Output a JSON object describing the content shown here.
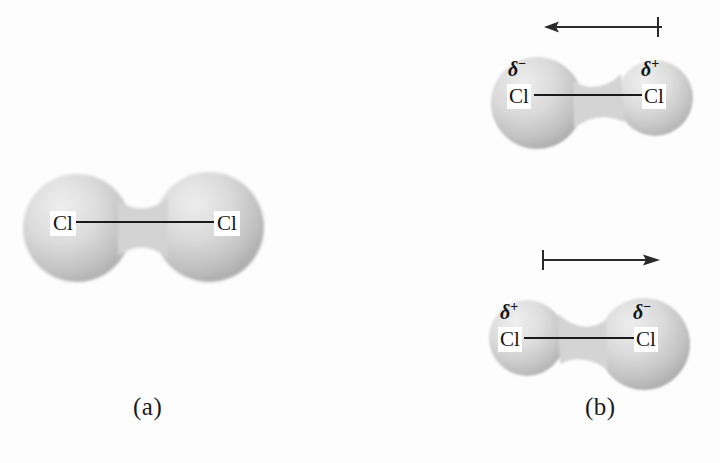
{
  "figure": {
    "background_color": "#fdfdfd",
    "sphere_light": "#ececec",
    "sphere_mid": "#d2d2d2",
    "sphere_dark": "#b0b0b0",
    "line_color": "#1a1a1a",
    "text_color": "#141414"
  },
  "panels": [
    {
      "id": "a",
      "label": "(a)",
      "description": "nonpolar-cl2-molecule",
      "atoms": [
        {
          "symbol": "Cl",
          "charge": ""
        },
        {
          "symbol": "Cl",
          "charge": ""
        }
      ],
      "dipole_arrow": null
    },
    {
      "id": "b",
      "label": "(b)",
      "description": "polarized-cl2-molecules-instantaneous-dipoles",
      "molecules": [
        {
          "id": "b-top",
          "atoms": [
            {
              "symbol": "Cl",
              "charge": "δ",
              "charge_sign": "−",
              "position": "left",
              "size": "large"
            },
            {
              "symbol": "Cl",
              "charge": "δ",
              "charge_sign": "+",
              "position": "right",
              "size": "small"
            }
          ],
          "dipole_arrow": {
            "direction": "left",
            "cross_end": "right"
          }
        },
        {
          "id": "b-bottom",
          "atoms": [
            {
              "symbol": "Cl",
              "charge": "δ",
              "charge_sign": "+",
              "position": "left",
              "size": "small"
            },
            {
              "symbol": "Cl",
              "charge": "δ",
              "charge_sign": "−",
              "position": "right",
              "size": "large"
            }
          ],
          "dipole_arrow": {
            "direction": "right",
            "cross_end": "left"
          }
        }
      ]
    }
  ],
  "labels": {
    "cl": "Cl",
    "delta": "δ",
    "minus": "−",
    "plus": "+",
    "panel_a": "(a)",
    "panel_b": "(b)"
  }
}
